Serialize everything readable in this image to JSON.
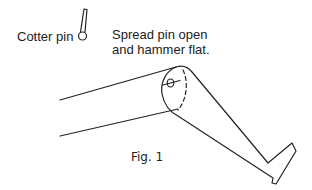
{
  "figure": {
    "caption": "Fig. 1",
    "labels": {
      "cotter_pin": "Cotter pin",
      "instruction_line_1": "Spread pin open",
      "instruction_line_2": "and hammer flat."
    },
    "icons": {
      "cotter_pin": "cotter-pin-icon",
      "hinge_pin": "hinge-pin-icon"
    },
    "colors": {
      "stroke": "#222222",
      "background": "#ffffff"
    }
  }
}
